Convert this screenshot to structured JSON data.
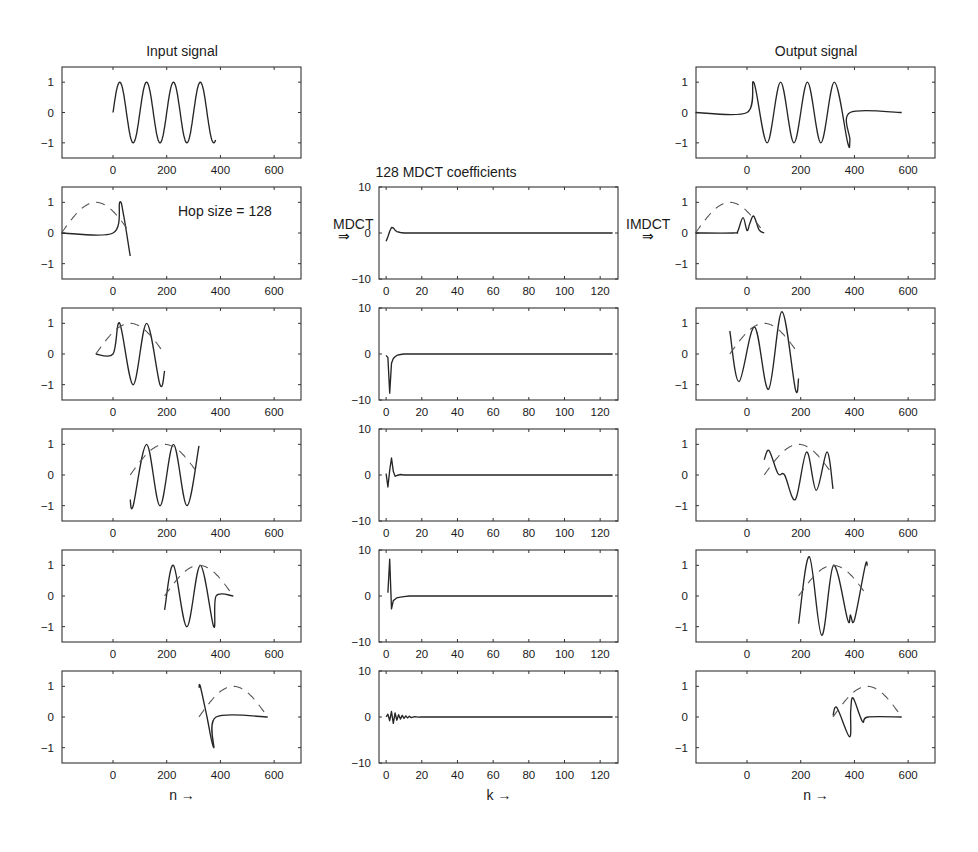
{
  "figure": {
    "columns": {
      "input": {
        "title": "Input signal",
        "xlabel": "n →"
      },
      "mdct": {
        "title": "128 MDCT coefficients",
        "xlabel": "k →"
      },
      "output": {
        "title": "Output signal",
        "xlabel": "n →"
      }
    },
    "annotations": {
      "hop_size": "Hop size = 128",
      "mdct_arrow_label": "MDCT",
      "mdct_arrow": "⇒",
      "imdct_arrow_label": "IMDCT",
      "imdct_arrow": "⇒"
    },
    "colors": {
      "line": "#262626",
      "window": "#555555",
      "frame": "#333333",
      "background": "#ffffff"
    }
  },
  "chart_data": [
    {
      "type": "line",
      "panel": "input-row-1",
      "title": "Input signal",
      "xlabel": "",
      "ylabel": "",
      "xlim": [
        -190,
        700
      ],
      "ylim": [
        -1.5,
        1.5
      ],
      "xticks": [
        0,
        200,
        400,
        600
      ],
      "yticks": [
        1,
        0,
        -1
      ],
      "series": [
        {
          "name": "input sine (4 periods, n=0..383)",
          "style": "solid",
          "description": "sin(2*pi*n/100) for n in 0..383",
          "x": [
            0,
            25,
            50,
            75,
            100,
            125,
            150,
            175,
            200,
            225,
            250,
            275,
            300,
            325,
            350,
            375,
            383
          ],
          "y": [
            0,
            1,
            0,
            -1,
            0,
            1,
            0,
            -1,
            0,
            1,
            0,
            -1,
            0,
            1,
            0,
            -1,
            -0.88
          ]
        }
      ]
    },
    {
      "type": "line",
      "panel": "input-row-2",
      "annotation": "Hop size = 128",
      "xlim": [
        -190,
        700
      ],
      "ylim": [
        -1.5,
        1.5
      ],
      "xticks": [
        0,
        200,
        400,
        600
      ],
      "yticks": [
        1,
        0,
        -1
      ],
      "series": [
        {
          "name": "windowed frame",
          "style": "solid",
          "x": [
            -192,
            0,
            25,
            40,
            64
          ],
          "y": [
            0,
            0,
            1,
            0.55,
            -0.75
          ]
        },
        {
          "name": "sine window",
          "style": "dashed",
          "x": [
            -192,
            -128,
            -64,
            0,
            64
          ],
          "y": [
            0,
            0.71,
            1,
            0.71,
            0
          ]
        }
      ]
    },
    {
      "type": "line",
      "panel": "input-row-3",
      "xlim": [
        -190,
        700
      ],
      "ylim": [
        -1.5,
        1.5
      ],
      "xticks": [
        0,
        200,
        400,
        600
      ],
      "yticks": [
        1,
        0,
        -1
      ],
      "series": [
        {
          "name": "windowed frame",
          "style": "solid",
          "x": [
            -64,
            0,
            25,
            75,
            125,
            175,
            192
          ],
          "y": [
            0,
            0,
            1,
            -1,
            1,
            -1,
            -0.55
          ]
        },
        {
          "name": "sine window",
          "style": "dashed",
          "x": [
            -64,
            0,
            64,
            128,
            192
          ],
          "y": [
            0,
            0.71,
            1,
            0.71,
            0
          ]
        }
      ]
    },
    {
      "type": "line",
      "panel": "input-row-4",
      "xlim": [
        -190,
        700
      ],
      "ylim": [
        -1.5,
        1.5
      ],
      "xticks": [
        0,
        200,
        400,
        600
      ],
      "yticks": [
        1,
        0,
        -1
      ],
      "series": [
        {
          "name": "windowed frame",
          "style": "solid",
          "x": [
            64,
            75,
            125,
            175,
            225,
            275,
            320
          ],
          "y": [
            -0.8,
            -1,
            1,
            -1,
            1,
            -1,
            0.95
          ]
        },
        {
          "name": "sine window",
          "style": "dashed",
          "x": [
            64,
            128,
            192,
            256,
            320
          ],
          "y": [
            0,
            0.71,
            1,
            0.71,
            0
          ]
        }
      ]
    },
    {
      "type": "line",
      "panel": "input-row-5",
      "xlim": [
        -190,
        700
      ],
      "ylim": [
        -1.5,
        1.5
      ],
      "xticks": [
        0,
        200,
        400,
        600
      ],
      "yticks": [
        1,
        0,
        -1
      ],
      "series": [
        {
          "name": "windowed frame",
          "style": "solid",
          "x": [
            192,
            225,
            275,
            325,
            375,
            384,
            448
          ],
          "y": [
            -0.45,
            1,
            -1,
            1,
            -1,
            0,
            0
          ]
        },
        {
          "name": "sine window",
          "style": "dashed",
          "x": [
            192,
            256,
            320,
            384,
            448
          ],
          "y": [
            0,
            0.71,
            1,
            0.71,
            0
          ]
        }
      ]
    },
    {
      "type": "line",
      "panel": "input-row-6",
      "xlabel": "n →",
      "xlim": [
        -190,
        700
      ],
      "ylim": [
        -1.5,
        1.5
      ],
      "xticks": [
        0,
        200,
        400,
        600
      ],
      "yticks": [
        1,
        0,
        -1
      ],
      "series": [
        {
          "name": "windowed frame",
          "style": "solid",
          "x": [
            320,
            325,
            350,
            375,
            384,
            576
          ],
          "y": [
            0.95,
            1,
            0,
            -1,
            0,
            0
          ]
        },
        {
          "name": "sine window",
          "style": "dashed",
          "x": [
            320,
            384,
            448,
            512,
            576
          ],
          "y": [
            0,
            0.71,
            1,
            0.71,
            0
          ]
        }
      ]
    },
    {
      "type": "line",
      "panel": "mdct-row-2",
      "title": "128 MDCT coefficients",
      "xlim": [
        -4,
        130
      ],
      "ylim": [
        -10,
        10
      ],
      "xticks": [
        0,
        20,
        40,
        60,
        80,
        100,
        120
      ],
      "yticks": [
        10,
        0,
        -10
      ],
      "series": [
        {
          "name": "MDCT coefficients",
          "style": "solid",
          "x": [
            0,
            1,
            2,
            3,
            4,
            5,
            6,
            8,
            10,
            127
          ],
          "y": [
            -1.8,
            -0.8,
            0.4,
            1.2,
            1.1,
            0.6,
            0.3,
            0.1,
            0,
            0
          ]
        }
      ]
    },
    {
      "type": "line",
      "panel": "mdct-row-3",
      "xlim": [
        -4,
        130
      ],
      "ylim": [
        -10,
        10
      ],
      "xticks": [
        0,
        20,
        40,
        60,
        80,
        100,
        120
      ],
      "yticks": [
        10,
        0,
        -10
      ],
      "series": [
        {
          "name": "MDCT coefficients",
          "style": "solid",
          "x": [
            0,
            1,
            2,
            3,
            4,
            5,
            6,
            8,
            10,
            127
          ],
          "y": [
            -0.3,
            -0.8,
            -8.5,
            -2,
            -1,
            -0.6,
            -0.3,
            -0.1,
            0,
            0
          ]
        }
      ]
    },
    {
      "type": "line",
      "panel": "mdct-row-4",
      "xlim": [
        -4,
        130
      ],
      "ylim": [
        -10,
        10
      ],
      "xticks": [
        0,
        20,
        40,
        60,
        80,
        100,
        120
      ],
      "yticks": [
        10,
        0,
        -10
      ],
      "series": [
        {
          "name": "MDCT coefficients",
          "style": "solid",
          "x": [
            0,
            1,
            2,
            3,
            4,
            5,
            6,
            8,
            10,
            127
          ],
          "y": [
            0.3,
            -2.6,
            1,
            3.7,
            0.8,
            -0.3,
            -0.1,
            0.1,
            0,
            0
          ]
        }
      ]
    },
    {
      "type": "line",
      "panel": "mdct-row-5",
      "xlim": [
        -4,
        130
      ],
      "ylim": [
        -10,
        10
      ],
      "xticks": [
        0,
        20,
        40,
        60,
        80,
        100,
        120
      ],
      "yticks": [
        10,
        0,
        -10
      ],
      "series": [
        {
          "name": "MDCT coefficients",
          "style": "solid",
          "x": [
            1,
            2,
            3,
            4,
            5,
            6,
            8,
            10,
            13,
            127
          ],
          "y": [
            0.7,
            8,
            -2.8,
            -1,
            -0.7,
            -0.4,
            -0.25,
            -0.12,
            0,
            0
          ]
        }
      ]
    },
    {
      "type": "line",
      "panel": "mdct-row-6",
      "xlabel": "k →",
      "xlim": [
        -4,
        130
      ],
      "ylim": [
        -10,
        10
      ],
      "xticks": [
        0,
        20,
        40,
        60,
        80,
        100,
        120
      ],
      "yticks": [
        10,
        0,
        -10
      ],
      "series": [
        {
          "name": "MDCT coefficients",
          "style": "solid",
          "x": [
            0,
            1,
            2,
            3,
            4,
            5,
            6,
            7,
            8,
            9,
            10,
            11,
            12,
            13,
            14,
            16,
            18,
            20,
            127
          ],
          "y": [
            0,
            0.6,
            -0.8,
            1.2,
            -1.4,
            0.9,
            -0.7,
            0.5,
            -0.45,
            0.35,
            -0.3,
            0.25,
            -0.2,
            0.15,
            -0.12,
            0.08,
            -0.05,
            0,
            0
          ]
        }
      ]
    },
    {
      "type": "line",
      "panel": "output-row-1",
      "title": "Output signal",
      "xlim": [
        -190,
        700
      ],
      "ylim": [
        -1.5,
        1.5
      ],
      "xticks": [
        0,
        200,
        400,
        600
      ],
      "yticks": [
        1,
        0,
        -1
      ],
      "series": [
        {
          "name": "reconstructed output",
          "style": "solid",
          "x": [
            -192,
            0,
            25,
            75,
            125,
            175,
            225,
            275,
            325,
            375,
            383,
            384,
            576
          ],
          "y": [
            0,
            0,
            1,
            -1,
            1,
            -1,
            1,
            -1,
            1,
            -1,
            -0.9,
            0,
            0
          ]
        }
      ]
    },
    {
      "type": "line",
      "panel": "output-row-2",
      "xlim": [
        -190,
        700
      ],
      "ylim": [
        -1.5,
        1.5
      ],
      "xticks": [
        0,
        200,
        400,
        600
      ],
      "yticks": [
        1,
        0,
        -1
      ],
      "series": [
        {
          "name": "IMDCT frame",
          "style": "solid",
          "x": [
            -192,
            -50,
            -35,
            -15,
            0,
            10,
            25,
            45,
            64
          ],
          "y": [
            0,
            0,
            0.05,
            0.5,
            0.08,
            0.3,
            0.55,
            0.1,
            0
          ]
        },
        {
          "name": "sine window",
          "style": "dashed",
          "x": [
            -192,
            -128,
            -64,
            0,
            64
          ],
          "y": [
            0,
            0.71,
            1,
            0.71,
            0
          ]
        }
      ]
    },
    {
      "type": "line",
      "panel": "output-row-3",
      "xlim": [
        -190,
        700
      ],
      "ylim": [
        -1.5,
        1.5
      ],
      "xticks": [
        0,
        200,
        400,
        600
      ],
      "yticks": [
        1,
        0,
        -1
      ],
      "series": [
        {
          "name": "IMDCT frame",
          "style": "solid",
          "x": [
            -64,
            -30,
            28,
            80,
            130,
            180,
            192
          ],
          "y": [
            0.75,
            -0.9,
            0.88,
            -1.15,
            1.38,
            -1.15,
            -0.8
          ]
        },
        {
          "name": "sine window",
          "style": "dashed",
          "x": [
            -64,
            0,
            64,
            128,
            192
          ],
          "y": [
            0,
            0.71,
            1,
            0.71,
            0
          ]
        }
      ]
    },
    {
      "type": "line",
      "panel": "output-row-4",
      "xlim": [
        -190,
        700
      ],
      "ylim": [
        -1.5,
        1.5
      ],
      "xticks": [
        0,
        200,
        400,
        600
      ],
      "yticks": [
        1,
        0,
        -1
      ],
      "series": [
        {
          "name": "IMDCT frame",
          "style": "solid",
          "x": [
            64,
            82,
            115,
            140,
            180,
            222,
            258,
            298,
            320
          ],
          "y": [
            0.5,
            0.8,
            0.05,
            0,
            -0.8,
            0.75,
            -0.5,
            0.75,
            -0.45
          ]
        },
        {
          "name": "sine window",
          "style": "dashed",
          "x": [
            64,
            128,
            192,
            256,
            320
          ],
          "y": [
            0,
            0.71,
            1,
            0.71,
            0
          ]
        }
      ]
    },
    {
      "type": "line",
      "panel": "output-row-5",
      "xlim": [
        -190,
        700
      ],
      "ylim": [
        -1.5,
        1.5
      ],
      "xticks": [
        0,
        200,
        400,
        600
      ],
      "yticks": [
        1,
        0,
        -1
      ],
      "series": [
        {
          "name": "IMDCT frame",
          "style": "solid",
          "x": [
            192,
            232,
            278,
            322,
            375,
            385,
            400,
            440,
            448
          ],
          "y": [
            -0.9,
            1.28,
            -1.28,
            1.0,
            -0.78,
            -0.62,
            -0.78,
            0.98,
            0.98
          ]
        },
        {
          "name": "sine window",
          "style": "dashed",
          "x": [
            192,
            256,
            320,
            384,
            448
          ],
          "y": [
            0,
            0.71,
            1,
            0.71,
            0
          ]
        }
      ]
    },
    {
      "type": "line",
      "panel": "output-row-6",
      "xlabel": "n →",
      "xlim": [
        -190,
        700
      ],
      "ylim": [
        -1.5,
        1.5
      ],
      "xticks": [
        0,
        200,
        400,
        600
      ],
      "yticks": [
        1,
        0,
        -1
      ],
      "series": [
        {
          "name": "IMDCT frame",
          "style": "solid",
          "x": [
            320,
            335,
            382,
            386,
            395,
            430,
            450,
            576
          ],
          "y": [
            0.05,
            0.3,
            -0.65,
            0.2,
            0.62,
            -0.15,
            0,
            0
          ]
        },
        {
          "name": "sine window",
          "style": "dashed",
          "x": [
            320,
            384,
            448,
            512,
            576
          ],
          "y": [
            0,
            0.71,
            1,
            0.71,
            0
          ]
        }
      ]
    }
  ]
}
